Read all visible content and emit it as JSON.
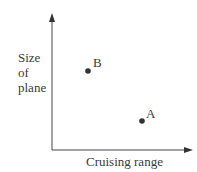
{
  "diagram": {
    "y_axis_label": [
      "Size",
      "of",
      "plane"
    ],
    "x_axis_label": "Cruising range",
    "points": [
      {
        "label": "B",
        "x": 88,
        "y": 71
      },
      {
        "label": "A",
        "x": 142,
        "y": 121
      }
    ],
    "colors": {
      "axis": "#444444",
      "point": "#333333",
      "text": "#3a3a3a"
    }
  }
}
